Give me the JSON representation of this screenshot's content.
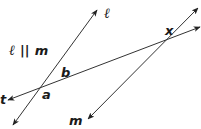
{
  "diagram": {
    "type": "geometry-parallel-lines-transversal",
    "statement": "ℓ || m",
    "lines": [
      {
        "name": "ℓ",
        "x1": 13,
        "y1": 125,
        "x2": 97,
        "y2": 10,
        "arrows": "both"
      },
      {
        "name": "m",
        "x1": 88,
        "y1": 119,
        "x2": 198,
        "y2": 8,
        "arrows": "both"
      },
      {
        "name": "t",
        "x1": 8,
        "y1": 100,
        "x2": 200,
        "y2": 27,
        "arrows": "both"
      }
    ],
    "labels": {
      "line_l": "ℓ",
      "line_l_part": "ℓ",
      "parallel_symbol": "||",
      "line_m_part": "m",
      "line_m": "m",
      "line_t": "t",
      "angle_a": "a",
      "angle_b": "b",
      "angle_x": "x"
    },
    "stroke_color": "#333333",
    "text_color": "#1a1a1a"
  }
}
